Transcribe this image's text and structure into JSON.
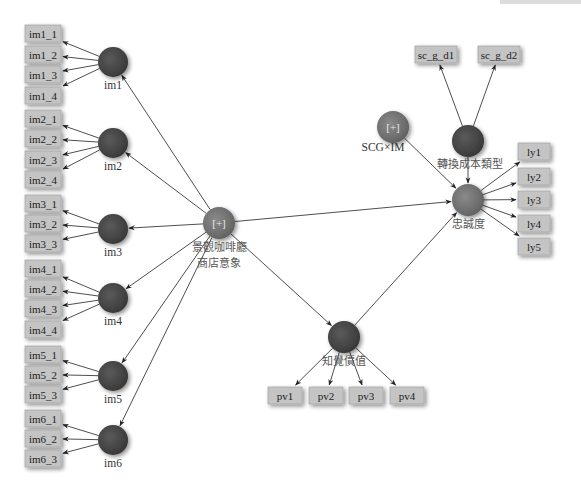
{
  "diagram": {
    "colors": {
      "latent_fill_dark": "#4a4a4a",
      "latent_fill_light": "#6e6e6e",
      "indicator_fill": "#c4c4c4",
      "edge": "#3a3a3a",
      "background": "#ffffff"
    },
    "latent_variables": [
      {
        "id": "im1",
        "label": "im1",
        "x": 113,
        "y": 62,
        "r": 15,
        "style": "dark"
      },
      {
        "id": "im2",
        "label": "im2",
        "x": 113,
        "y": 143,
        "r": 15,
        "style": "dark"
      },
      {
        "id": "im3",
        "label": "im3",
        "x": 113,
        "y": 229,
        "r": 15,
        "style": "dark"
      },
      {
        "id": "im4",
        "label": "im4",
        "x": 113,
        "y": 298,
        "r": 15,
        "style": "dark"
      },
      {
        "id": "im5",
        "label": "im5",
        "x": 113,
        "y": 376,
        "r": 15,
        "style": "dark"
      },
      {
        "id": "im6",
        "label": "im6",
        "x": 113,
        "y": 440,
        "r": 15,
        "style": "dark"
      },
      {
        "id": "hub",
        "label": "[+]",
        "x": 219,
        "y": 223,
        "r": 16,
        "style": "light",
        "sublabel": [
          "景觀咖啡廳",
          "商店意象"
        ]
      },
      {
        "id": "scgim",
        "label": "[+]",
        "x": 393,
        "y": 127,
        "r": 16,
        "style": "light",
        "sublabel": [
          "SCG×IM"
        ]
      },
      {
        "id": "sctype",
        "label": "",
        "x": 468,
        "y": 141,
        "r": 16,
        "style": "dark",
        "sublabel": [
          "轉換成本類型"
        ]
      },
      {
        "id": "loyalty",
        "label": "",
        "x": 468,
        "y": 200,
        "r": 16,
        "style": "light",
        "sublabel": [
          "忠誠度"
        ]
      },
      {
        "id": "pv",
        "label": "",
        "x": 344,
        "y": 337,
        "r": 16,
        "style": "dark",
        "sublabel": [
          "知覺價值"
        ]
      }
    ],
    "indicators": [
      {
        "label": "im1_1",
        "x": 25,
        "y": 25,
        "w": 36,
        "h": 17,
        "from": "im1"
      },
      {
        "label": "im1_2",
        "x": 25,
        "y": 46,
        "w": 36,
        "h": 17,
        "from": "im1"
      },
      {
        "label": "im1_3",
        "x": 25,
        "y": 66,
        "w": 36,
        "h": 17,
        "from": "im1"
      },
      {
        "label": "im1_4",
        "x": 25,
        "y": 87,
        "w": 36,
        "h": 17,
        "from": "im1"
      },
      {
        "label": "im2_1",
        "x": 25,
        "y": 110,
        "w": 36,
        "h": 17,
        "from": "im2"
      },
      {
        "label": "im2_2",
        "x": 25,
        "y": 130,
        "w": 36,
        "h": 17,
        "from": "im2"
      },
      {
        "label": "im2_3",
        "x": 25,
        "y": 151,
        "w": 36,
        "h": 17,
        "from": "im2"
      },
      {
        "label": "im2_4",
        "x": 25,
        "y": 171,
        "w": 36,
        "h": 17,
        "from": "im2"
      },
      {
        "label": "im3_1",
        "x": 25,
        "y": 195,
        "w": 36,
        "h": 17,
        "from": "im3"
      },
      {
        "label": "im3_2",
        "x": 25,
        "y": 215,
        "w": 36,
        "h": 17,
        "from": "im3"
      },
      {
        "label": "im3_3",
        "x": 25,
        "y": 235,
        "w": 36,
        "h": 17,
        "from": "im3"
      },
      {
        "label": "im4_1",
        "x": 25,
        "y": 260,
        "w": 36,
        "h": 17,
        "from": "im4"
      },
      {
        "label": "im4_2",
        "x": 25,
        "y": 280,
        "w": 36,
        "h": 17,
        "from": "im4"
      },
      {
        "label": "im4_3",
        "x": 25,
        "y": 300,
        "w": 36,
        "h": 17,
        "from": "im4"
      },
      {
        "label": "im4_4",
        "x": 25,
        "y": 321,
        "w": 36,
        "h": 17,
        "from": "im4"
      },
      {
        "label": "im5_1",
        "x": 25,
        "y": 346,
        "w": 36,
        "h": 17,
        "from": "im5"
      },
      {
        "label": "im5_2",
        "x": 25,
        "y": 366,
        "w": 36,
        "h": 17,
        "from": "im5"
      },
      {
        "label": "im5_3",
        "x": 25,
        "y": 386,
        "w": 36,
        "h": 17,
        "from": "im5"
      },
      {
        "label": "im6_1",
        "x": 25,
        "y": 410,
        "w": 36,
        "h": 17,
        "from": "im6"
      },
      {
        "label": "im6_2",
        "x": 25,
        "y": 430,
        "w": 36,
        "h": 17,
        "from": "im6"
      },
      {
        "label": "im6_3",
        "x": 25,
        "y": 450,
        "w": 36,
        "h": 17,
        "from": "im6"
      },
      {
        "label": "sc_g_d1",
        "x": 415,
        "y": 46,
        "w": 42,
        "h": 17,
        "from": "sctype"
      },
      {
        "label": "sc_g_d2",
        "x": 478,
        "y": 46,
        "w": 42,
        "h": 17,
        "from": "sctype"
      },
      {
        "label": "ly1",
        "x": 518,
        "y": 143,
        "w": 32,
        "h": 17,
        "from": "loyalty"
      },
      {
        "label": "ly2",
        "x": 518,
        "y": 168,
        "w": 32,
        "h": 17,
        "from": "loyalty"
      },
      {
        "label": "ly3",
        "x": 518,
        "y": 191,
        "w": 32,
        "h": 17,
        "from": "loyalty"
      },
      {
        "label": "ly4",
        "x": 518,
        "y": 215,
        "w": 32,
        "h": 17,
        "from": "loyalty"
      },
      {
        "label": "ly5",
        "x": 518,
        "y": 238,
        "w": 32,
        "h": 17,
        "from": "loyalty"
      },
      {
        "label": "pv1",
        "x": 268,
        "y": 387,
        "w": 34,
        "h": 17,
        "from": "pv"
      },
      {
        "label": "pv2",
        "x": 309,
        "y": 387,
        "w": 34,
        "h": 17,
        "from": "pv"
      },
      {
        "label": "pv3",
        "x": 349,
        "y": 387,
        "w": 34,
        "h": 17,
        "from": "pv"
      },
      {
        "label": "pv4",
        "x": 390,
        "y": 387,
        "w": 34,
        "h": 17,
        "from": "pv"
      }
    ],
    "structural_paths": [
      {
        "from": "hub",
        "to": "im1"
      },
      {
        "from": "hub",
        "to": "im2"
      },
      {
        "from": "hub",
        "to": "im3"
      },
      {
        "from": "hub",
        "to": "im4"
      },
      {
        "from": "hub",
        "to": "im5"
      },
      {
        "from": "hub",
        "to": "im6"
      },
      {
        "from": "hub",
        "to": "loyalty"
      },
      {
        "from": "hub",
        "to": "pv"
      },
      {
        "from": "pv",
        "to": "loyalty"
      },
      {
        "from": "scgim",
        "to": "loyalty"
      },
      {
        "from": "sctype",
        "to": "loyalty"
      }
    ]
  }
}
